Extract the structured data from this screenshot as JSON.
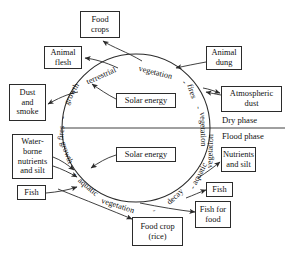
{
  "diagram": {
    "type": "cycle-diagram",
    "stroke_color": "#2b2b2b",
    "text_color": "#111111",
    "background": "#ffffff"
  },
  "phases": {
    "dry": "Dry phase",
    "flood": "Flood phase"
  },
  "boxes": {
    "food_crops": "Food\ncrops",
    "animal_flesh": "Animal\nflesh",
    "animal_dung": "Animal\ndung",
    "dust_and_smoke": "Dust\nand\nsmoke",
    "atmospheric_dust": "Atmospheric\ndust",
    "solar_energy_top": "Solar energy",
    "solar_energy_bottom": "Solar energy",
    "waterborne_nutrients": "Water-\nborne\nnutrients\nand silt",
    "fish_left": "Fish",
    "food_crop_rice": "Food crop\n(rice)",
    "nutrients_and_silt": "Nutrients\nand silt",
    "fish_right": "Fish",
    "fish_for_food": "Fish for\nfood"
  },
  "arc_labels": {
    "growth_upper_left": "growth",
    "terrestrial": "terrestrial",
    "vegetation_upper": "vegetation",
    "fires_upper_right": "fires",
    "fires_upper_left": "fires",
    "vegetation_right": "vegetation",
    "growth_lower_left": "growth",
    "aquatic_lower_left": "aquatic",
    "vegetation_lower": "vegetation",
    "decay": "decay",
    "aquatic_lower_right": "aquatic",
    "dash_1": "-",
    "dash_2": "-",
    "dash_3": "-",
    "dash_4": "-",
    "dash_5": "-",
    "dash_6": "-",
    "dash_7": "-"
  }
}
